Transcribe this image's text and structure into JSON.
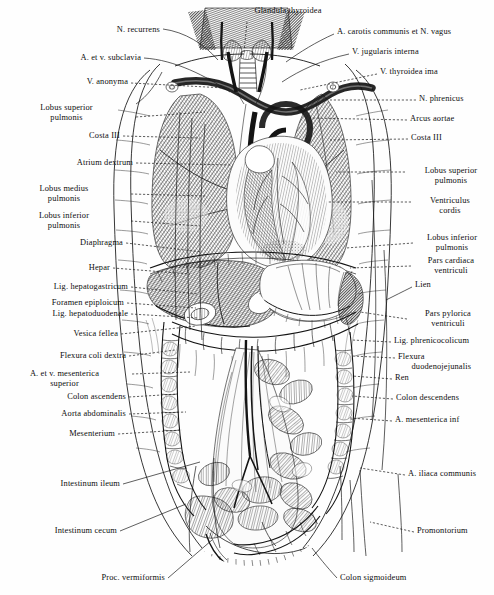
{
  "plate": {
    "title_top": "Glandula thyroidea",
    "subject": "Situs viscerum — thorax and abdomen, anterior view",
    "style": "steel engraving, black ink on white",
    "width": 494,
    "height": 595,
    "ink_color": "#141414",
    "paper_color": "#fefefe"
  },
  "labels_left": [
    {
      "id": "n-recurrens",
      "text": "N. recurrens",
      "x": 160,
      "y": 30,
      "align": "right",
      "leader": "solid"
    },
    {
      "id": "a-et-v-subclavia",
      "text": "A. et v. subclavia",
      "x": 141,
      "y": 58,
      "align": "right",
      "leader": "solid"
    },
    {
      "id": "v-anonyma",
      "text": "V. anonyma",
      "x": 128,
      "y": 82,
      "align": "right",
      "leader": "dash"
    },
    {
      "id": "lobus-superior-pulm-l",
      "text": "Lobus superior\npulmonis",
      "x": 133,
      "y": 108,
      "align": "right",
      "leader": "dash"
    },
    {
      "id": "costa-iii-left",
      "text": "Costa III",
      "x": 120,
      "y": 136,
      "align": "right",
      "leader": "dash"
    },
    {
      "id": "atrium-dextrum",
      "text": "Atrium dextrum",
      "x": 133,
      "y": 163,
      "align": "right",
      "leader": "dash"
    },
    {
      "id": "lobus-medius-pulm",
      "text": "Lobus medius\npulmonis",
      "x": 128,
      "y": 189,
      "align": "right",
      "leader": "dash"
    },
    {
      "id": "lobus-inferior-pulm-l",
      "text": "Lobus inferior\npulmonis",
      "x": 128,
      "y": 216,
      "align": "right",
      "leader": "dash"
    },
    {
      "id": "diaphragma",
      "text": "Diaphragma",
      "x": 123,
      "y": 243,
      "align": "right",
      "leader": "dash"
    },
    {
      "id": "hepar",
      "text": "Hepar",
      "x": 110,
      "y": 268,
      "align": "right",
      "leader": "dash"
    },
    {
      "id": "lig-hepatogastricum",
      "text": "Lig. hepatogastricum",
      "x": 128,
      "y": 287,
      "align": "right",
      "leader": "dash"
    },
    {
      "id": "foramen-epiploicum",
      "text": "Foramen epiploicum",
      "x": 124,
      "y": 303,
      "align": "right",
      "leader": "dash"
    },
    {
      "id": "lig-hepatoduodenale",
      "text": "Lig. hepatoduodenale",
      "x": 128,
      "y": 314,
      "align": "right",
      "leader": "dash"
    },
    {
      "id": "vesica-fellea",
      "text": "Vesica fellea",
      "x": 118,
      "y": 334,
      "align": "right",
      "leader": "dash"
    },
    {
      "id": "flexura-coli-dextra",
      "text": "Flexura coli dextra",
      "x": 126,
      "y": 356,
      "align": "right",
      "leader": "dash"
    },
    {
      "id": "a-et-v-mesent-sup",
      "text": "A. et v. mesenterica\nsuperior",
      "x": 129,
      "y": 374,
      "align": "right",
      "leader": "dash"
    },
    {
      "id": "colon-ascendens",
      "text": "Colon ascendens",
      "x": 126,
      "y": 397,
      "align": "right",
      "leader": "dash"
    },
    {
      "id": "aorta-abdominalis",
      "text": "Aorta abdominalis",
      "x": 126,
      "y": 414,
      "align": "right",
      "leader": "dash"
    },
    {
      "id": "mesenterium",
      "text": "Mesenterium",
      "x": 115,
      "y": 434,
      "align": "right",
      "leader": "dash"
    },
    {
      "id": "intestinum-ileum",
      "text": "Intestinum ileum",
      "x": 120,
      "y": 484,
      "align": "right",
      "leader": "solid"
    },
    {
      "id": "intestinum-cecum",
      "text": "Intestinum cecum",
      "x": 117,
      "y": 531,
      "align": "right",
      "leader": "solid"
    },
    {
      "id": "proc-vermiformis",
      "text": "Proc. vermiformis",
      "x": 165,
      "y": 578,
      "align": "right",
      "leader": "solid"
    }
  ],
  "labels_right": [
    {
      "id": "a-carotis-communis",
      "text": "A. carotis communis et N. vagus",
      "x": 337,
      "y": 32,
      "align": "left",
      "leader": "solid"
    },
    {
      "id": "v-jugularis-interna",
      "text": "V. jugularis interna",
      "x": 352,
      "y": 52,
      "align": "left",
      "leader": "solid"
    },
    {
      "id": "v-thyroidea-ima",
      "text": "V. thyroidea ima",
      "x": 380,
      "y": 72,
      "align": "left",
      "leader": "dash"
    },
    {
      "id": "n-phrenicus",
      "text": "N. phrenicus",
      "x": 419,
      "y": 99,
      "align": "left",
      "leader": "dash"
    },
    {
      "id": "arcus-aortae",
      "text": "Arcus aortae",
      "x": 410,
      "y": 119,
      "align": "left",
      "leader": "dash"
    },
    {
      "id": "costa-iii-right",
      "text": "Costa III",
      "x": 411,
      "y": 138,
      "align": "left",
      "leader": "dash"
    },
    {
      "id": "lobus-superior-pulm-r",
      "text": "Lobus superior\npulmonis",
      "x": 408,
      "y": 171,
      "align": "left",
      "leader": "dash"
    },
    {
      "id": "ventriculus-cordis",
      "text": "Ventriculus\ncordis",
      "x": 414,
      "y": 201,
      "align": "left",
      "leader": "dash"
    },
    {
      "id": "lobus-inferior-pulm-r",
      "text": "Lobus inferior\npulmonis",
      "x": 416,
      "y": 238,
      "align": "left",
      "leader": "dash"
    },
    {
      "id": "pars-cardiaca-ventr",
      "text": "Pars cardiaca\nventriculi",
      "x": 414,
      "y": 261,
      "align": "left",
      "leader": "dash"
    },
    {
      "id": "lien",
      "text": "Lien",
      "x": 415,
      "y": 285,
      "align": "left",
      "leader": "solid"
    },
    {
      "id": "pars-pylorica-ventr",
      "text": "Pars pylorica\nventriculi",
      "x": 410,
      "y": 314,
      "align": "left",
      "leader": "dash"
    },
    {
      "id": "lig-phrenicocolicum",
      "text": "Lig. phrenicocolicum",
      "x": 394,
      "y": 341,
      "align": "left",
      "leader": "dash"
    },
    {
      "id": "flexura-duodenojej",
      "text": "Flexura\n      duodenojejunalis",
      "x": 398,
      "y": 357,
      "align": "left",
      "leader": "dash"
    },
    {
      "id": "ren",
      "text": "Ren",
      "x": 395,
      "y": 378,
      "align": "left",
      "leader": "dash"
    },
    {
      "id": "colon-descendens",
      "text": "Colon descendens",
      "x": 396,
      "y": 398,
      "align": "left",
      "leader": "dash"
    },
    {
      "id": "a-mesenterica-inf",
      "text": "A. mesenterica inf",
      "x": 395,
      "y": 420,
      "align": "left",
      "leader": "dash"
    },
    {
      "id": "a-iliaca-communis",
      "text": "A. iliaca communis",
      "x": 408,
      "y": 474,
      "align": "left",
      "leader": "dash"
    },
    {
      "id": "promontorium",
      "text": "Promontorium",
      "x": 417,
      "y": 531,
      "align": "left",
      "leader": "dash"
    },
    {
      "id": "colon-sigmoideum",
      "text": "Colon sigmoideum",
      "x": 340,
      "y": 578,
      "align": "left",
      "leader": "solid"
    }
  ],
  "label_top": {
    "id": "glandula-thyroidea",
    "text": "Glandula thyroidea",
    "x": 288,
    "y": 10,
    "align": "center",
    "leader": "dash"
  },
  "structures": [
    "thyroid gland",
    "trachea",
    "right lung",
    "left lung",
    "heart",
    "aortic arch",
    "diaphragm",
    "liver",
    "stomach",
    "spleen",
    "gallbladder",
    "transverse colon",
    "ascending colon",
    "descending colon",
    "small intestine",
    "cecum",
    "vermiform appendix",
    "sigmoid colon",
    "ribs",
    "sternum"
  ]
}
